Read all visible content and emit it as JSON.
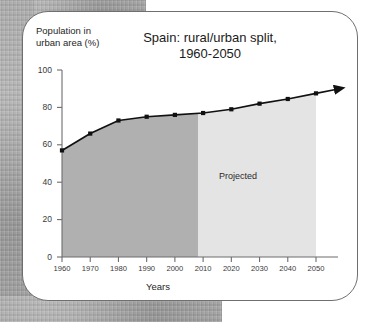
{
  "figure": {
    "background_color": "#a9a9a9",
    "card_color": "#ffffff",
    "card_border_color": "#6f6f6f"
  },
  "chart_data": {
    "type": "area",
    "title": "Spain: rural/urban split,",
    "title_line2": "1960-2050",
    "xlabel": "Years",
    "ylabel": "Population in",
    "ylabel_line2": "urban area (%)",
    "categories": [
      1960,
      1970,
      1980,
      1990,
      2000,
      2010,
      2020,
      2030,
      2040,
      2050
    ],
    "x": [
      1960,
      1970,
      1980,
      1990,
      2000,
      2010,
      2020,
      2030,
      2040,
      2050
    ],
    "values": [
      57,
      66,
      73,
      75,
      76,
      77,
      79,
      82,
      84.5,
      87.5
    ],
    "series": [
      {
        "name": "Population in urban area (%)",
        "values": [
          57,
          66,
          73,
          75,
          76,
          77,
          79,
          82,
          84.5,
          87.5
        ],
        "line_color": "#111111",
        "marker": "square",
        "marker_color": "#111111"
      }
    ],
    "xlim": [
      1960,
      2050
    ],
    "ylim": [
      0,
      100
    ],
    "xticks": [
      1960,
      1970,
      1980,
      1990,
      2000,
      2010,
      2020,
      2030,
      2040,
      2050
    ],
    "xtick_labels": [
      "1960",
      "1970",
      "1980",
      "1990",
      "2000",
      "2010",
      "2020",
      "2030",
      "2040",
      "2050"
    ],
    "yticks": [
      0,
      20,
      40,
      60,
      80,
      100
    ],
    "ytick_labels": [
      "0",
      "20",
      "40",
      "60",
      "80",
      "100"
    ],
    "grid": false,
    "legend": "none",
    "annotations": [
      {
        "text": "Projected",
        "x": 2027,
        "y": 43,
        "note": "label inside light-shaded projected region"
      }
    ],
    "regions": [
      {
        "name": "historical",
        "x_start": 1960,
        "x_end": 2008,
        "fill_color": "#b0b0b0"
      },
      {
        "name": "projected",
        "x_start": 2008,
        "x_end": 2050,
        "fill_color": "#e4e4e4"
      }
    ],
    "arrow": {
      "present": true,
      "direction": "right",
      "from_x": 2050,
      "note": "line terminates in an arrowhead extending past 2050"
    }
  },
  "ytick_labels": [
    "100",
    "80",
    "60",
    "40",
    "20",
    "0"
  ],
  "xtick_labels": [
    "1960",
    "1970",
    "1980",
    "1990",
    "2000",
    "2010",
    "2020",
    "2030",
    "2040",
    "2050"
  ]
}
